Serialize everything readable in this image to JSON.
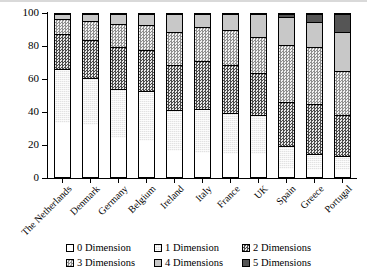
{
  "chart_data": {
    "type": "bar",
    "subtype": "stacked-bar-100",
    "title": "",
    "xlabel": "",
    "ylabel": "",
    "ylim": [
      0,
      100
    ],
    "yticks": [
      0,
      20,
      40,
      60,
      80,
      100
    ],
    "grid": false,
    "legend_position": "bottom",
    "categories": [
      "The Netherlands",
      "Denmark",
      "Germany",
      "Belgium",
      "Ireland",
      "Italy",
      "France",
      "UK",
      "Spain",
      "Greece",
      "Portugal"
    ],
    "series": [
      {
        "name": "0 Dimension",
        "pattern": "solid-white",
        "color": "#ffffff",
        "values": [
          33,
          32,
          24,
          22,
          16,
          15,
          14,
          14,
          5,
          4,
          4
        ]
      },
      {
        "name": "1 Dimension",
        "pattern": "light-dither",
        "color": "#e2e2e2",
        "values": [
          33,
          29,
          30,
          31,
          25,
          27,
          25,
          24,
          14,
          10,
          9
        ]
      },
      {
        "name": "2 Dimensions",
        "pattern": "dark-checker",
        "color": "#4a4a4a",
        "values": [
          22,
          23,
          26,
          25,
          28,
          29,
          30,
          26,
          27,
          31,
          25
        ]
      },
      {
        "name": "3 Dimensions",
        "pattern": "light-checker",
        "color": "#8f8f8f",
        "values": [
          9,
          12,
          14,
          15,
          20,
          21,
          21,
          22,
          35,
          35,
          27
        ]
      },
      {
        "name": "4 Dimensions",
        "pattern": "solid-grey",
        "color": "#c8c8c8",
        "values": [
          3,
          4,
          6,
          7,
          11,
          8,
          10,
          14,
          17,
          15,
          24
        ]
      },
      {
        "name": "5 Dimensions",
        "pattern": "solid-dark",
        "color": "#555555",
        "values": [
          0,
          0,
          0,
          0,
          0,
          0,
          0,
          0,
          2,
          5,
          11
        ]
      }
    ]
  },
  "axis": {
    "y_tick_labels": [
      "0",
      "20",
      "40",
      "60",
      "80",
      "100"
    ]
  },
  "legend": {
    "items": [
      {
        "label": "0 Dimension",
        "swatch": "swatch-0-dimension"
      },
      {
        "label": "1 Dimension",
        "swatch": "swatch-1-dimension"
      },
      {
        "label": "2 Dimensions",
        "swatch": "swatch-2-dimensions"
      },
      {
        "label": "3 Dimensions",
        "swatch": "swatch-3-dimensions"
      },
      {
        "label": "4 Dimensions",
        "swatch": "swatch-4-dimensions"
      },
      {
        "label": "5 Dimensions",
        "swatch": "swatch-5-dimensions"
      }
    ]
  }
}
